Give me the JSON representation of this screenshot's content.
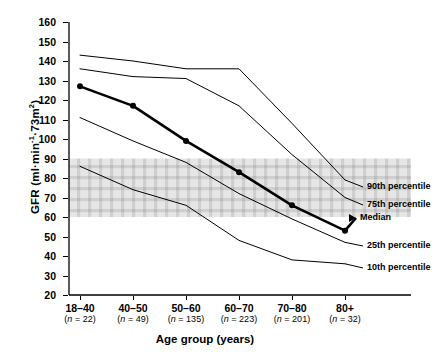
{
  "chart_data": {
    "type": "line",
    "title": "",
    "xlabel": "Age group (years)",
    "ylabel": "GFR (ml·min⁻¹·73m⁻²)",
    "ylabel_main": "GFR (ml·min",
    "ylabel_sup1": "-1",
    "ylabel_mid": "·73m",
    "ylabel_sup2": "2",
    "categories": [
      "18–40",
      "40–50",
      "50–60",
      "60–70",
      "70–80",
      "80+"
    ],
    "group_counts": [
      "(n = 22)",
      "(n = 49)",
      "(n = 135)",
      "(n = 223)",
      "(n = 201)",
      "(n = 32)"
    ],
    "n_values": [
      22,
      49,
      135,
      223,
      201,
      32
    ],
    "ylim": [
      20,
      160
    ],
    "yticks": [
      160,
      150,
      140,
      130,
      120,
      110,
      100,
      90,
      80,
      70,
      60,
      50,
      40,
      30,
      20
    ],
    "grid": false,
    "legend_position": "right-inline",
    "shaded_band": {
      "label": "",
      "from": 60,
      "to": 90,
      "color": "#d9d9d9"
    },
    "series": [
      {
        "name": "90th percentile",
        "label": "90th percentile",
        "values": [
          143,
          140,
          136,
          136,
          108,
          79
        ],
        "width": 1,
        "marker": false
      },
      {
        "name": "75th percentile",
        "label": "75th percentile",
        "values": [
          136,
          132,
          131,
          117,
          92,
          70
        ],
        "width": 1,
        "marker": false
      },
      {
        "name": "Median",
        "label": "Median",
        "values": [
          127,
          117,
          99,
          83,
          66,
          53
        ],
        "width": 2.6,
        "marker": true
      },
      {
        "name": "25th percentile",
        "label": "25th percentile",
        "values": [
          111,
          99,
          88,
          72,
          59,
          47
        ],
        "width": 1,
        "marker": false
      },
      {
        "name": "10th percentile",
        "label": "10th percentile",
        "values": [
          86,
          74,
          66,
          48,
          38,
          36
        ],
        "width": 1,
        "marker": false
      }
    ]
  }
}
